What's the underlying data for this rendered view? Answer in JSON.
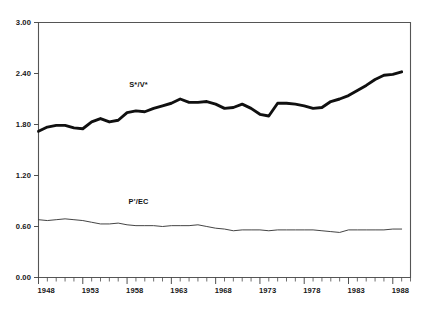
{
  "figure": {
    "background_color": "#ffffff",
    "ink_color": "#101010"
  },
  "chart_data": {
    "type": "line",
    "title": "",
    "subtitle": "",
    "xlabel": "",
    "ylabel": "",
    "grid": false,
    "legend_position": "inline-annotation",
    "xlim": [
      1948,
      1990
    ],
    "ylim": [
      0.0,
      3.0
    ],
    "y_ticks": [
      "0.00",
      "0.60",
      "1.20",
      "1.80",
      "2.40",
      "3.00"
    ],
    "y_tick_values": [
      0.0,
      0.6,
      1.2,
      1.8,
      2.4,
      3.0
    ],
    "x_ticks": [
      "1948",
      "1953",
      "1958",
      "1963",
      "1968",
      "1973",
      "1978",
      "1983",
      "1988"
    ],
    "x_tick_values": [
      1948,
      1953,
      1958,
      1963,
      1968,
      1973,
      1978,
      1983,
      1988
    ],
    "x_minor_tick_interval": 1,
    "x": [
      1948,
      1949,
      1950,
      1951,
      1952,
      1953,
      1954,
      1955,
      1956,
      1957,
      1958,
      1959,
      1960,
      1961,
      1962,
      1963,
      1964,
      1965,
      1966,
      1967,
      1968,
      1969,
      1970,
      1971,
      1972,
      1973,
      1974,
      1975,
      1976,
      1977,
      1978,
      1979,
      1980,
      1981,
      1982,
      1983,
      1984,
      1985,
      1986,
      1987,
      1988,
      1989
    ],
    "series": [
      {
        "name": "S*/V*",
        "style": "thick",
        "label_x": 1959.3,
        "label_y": 2.24,
        "values": [
          1.72,
          1.77,
          1.79,
          1.79,
          1.76,
          1.75,
          1.83,
          1.87,
          1.83,
          1.85,
          1.94,
          1.96,
          1.95,
          1.99,
          2.02,
          2.05,
          2.1,
          2.06,
          2.06,
          2.07,
          2.04,
          1.99,
          2.0,
          2.04,
          1.99,
          1.92,
          1.9,
          2.05,
          2.05,
          2.04,
          2.02,
          1.99,
          2.0,
          2.07,
          2.1,
          2.14,
          2.2,
          2.26,
          2.33,
          2.38,
          2.39,
          2.42
        ]
      },
      {
        "name": "P'/EC",
        "style": "thin",
        "label_x": 1959.3,
        "label_y": 0.86,
        "values": [
          0.68,
          0.67,
          0.68,
          0.69,
          0.68,
          0.67,
          0.65,
          0.63,
          0.63,
          0.64,
          0.62,
          0.61,
          0.61,
          0.61,
          0.6,
          0.61,
          0.61,
          0.61,
          0.62,
          0.6,
          0.58,
          0.57,
          0.55,
          0.56,
          0.56,
          0.56,
          0.55,
          0.56,
          0.56,
          0.56,
          0.56,
          0.56,
          0.55,
          0.54,
          0.53,
          0.56,
          0.56,
          0.56,
          0.56,
          0.56,
          0.57,
          0.57
        ]
      }
    ]
  }
}
